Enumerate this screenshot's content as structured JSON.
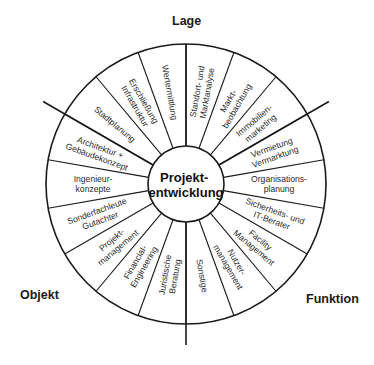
{
  "diagram": {
    "center_label": [
      "Projekt-",
      "entwicklung"
    ],
    "sectors": [
      {
        "name": "Lage",
        "label": "Lage"
      },
      {
        "name": "Funktion",
        "label": "Funktion"
      },
      {
        "name": "Objekt",
        "label": "Objekt"
      }
    ],
    "segments": [
      {
        "angle": 10,
        "lines": [
          "Standort- und",
          "Marktanalyse"
        ],
        "sector": "Lage"
      },
      {
        "angle": 30,
        "lines": [
          "Markt-",
          "beobachtung"
        ],
        "sector": "Lage"
      },
      {
        "angle": 50,
        "lines": [
          "Immobilien-",
          "marketing"
        ],
        "sector": "Lage"
      },
      {
        "angle": 70,
        "lines": [
          "Vermietung",
          "Vermarktung"
        ],
        "sector": "Funktion"
      },
      {
        "angle": 90,
        "lines": [
          "Organisations-",
          "planung"
        ],
        "sector": "Funktion"
      },
      {
        "angle": 110,
        "lines": [
          "Sicherheits- und",
          "IT-Berater"
        ],
        "sector": "Funktion"
      },
      {
        "angle": 130,
        "lines": [
          "Facility",
          "Management"
        ],
        "sector": "Funktion"
      },
      {
        "angle": 150,
        "lines": [
          "Nutzer-",
          "management"
        ],
        "sector": "Funktion"
      },
      {
        "angle": 170,
        "lines": [
          "Sonstige"
        ],
        "sector": "Funktion"
      },
      {
        "angle": 190,
        "lines": [
          "Juristische",
          "Beratung"
        ],
        "sector": "Objekt"
      },
      {
        "angle": 210,
        "lines": [
          "Financial-",
          "Engineering"
        ],
        "sector": "Objekt"
      },
      {
        "angle": 230,
        "lines": [
          "Projekt-",
          "management"
        ],
        "sector": "Objekt"
      },
      {
        "angle": 250,
        "lines": [
          "Sonderfachleute",
          "Gutachter"
        ],
        "sector": "Objekt"
      },
      {
        "angle": 270,
        "lines": [
          "Ingenieur-",
          "konzepte"
        ],
        "sector": "Objekt"
      },
      {
        "angle": 290,
        "lines": [
          "Architektur +",
          "Gebäudekonzept"
        ],
        "sector": "Objekt"
      },
      {
        "angle": 310,
        "lines": [
          "Stadtplanung"
        ],
        "sector": "Lage"
      },
      {
        "angle": 330,
        "lines": [
          "Erschließung",
          "Infrastruktur"
        ],
        "sector": "Lage"
      },
      {
        "angle": 350,
        "lines": [
          "Wertermittlung"
        ],
        "sector": "Lage"
      }
    ],
    "geometry": {
      "cx": 186,
      "cy": 184,
      "outer_r": 140,
      "inner_r": 38,
      "main_dividers": [
        {
          "angle": 0,
          "length": 140
        },
        {
          "angle": 60,
          "length": 165
        },
        {
          "angle": 180,
          "length": 161
        },
        {
          "angle": 300,
          "length": 165
        }
      ]
    },
    "colors": {
      "line": "#1a1a1a",
      "text": "#2a2a2a",
      "background": "#ffffff"
    }
  }
}
